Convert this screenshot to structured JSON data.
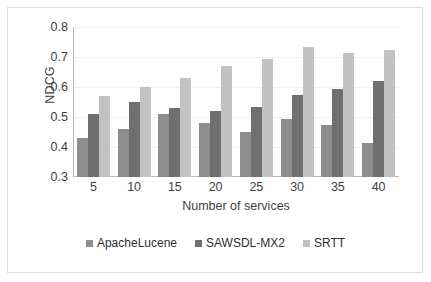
{
  "chart_data": {
    "type": "bar",
    "title": "",
    "subtitle": "",
    "xlabel": "Number of services",
    "ylabel": "NDCG",
    "categories": [
      "5",
      "10",
      "15",
      "20",
      "25",
      "30",
      "35",
      "40"
    ],
    "series": [
      {
        "name": "ApacheLucene",
        "color": "#8e8e8e",
        "values": [
          0.43,
          0.46,
          0.51,
          0.48,
          0.45,
          0.495,
          0.475,
          0.415
        ]
      },
      {
        "name": "SAWSDL-MX2",
        "color": "#6f6f6f",
        "values": [
          0.51,
          0.55,
          0.53,
          0.52,
          0.535,
          0.575,
          0.595,
          0.62
        ]
      },
      {
        "name": "SRTT",
        "color": "#c2c2c2",
        "values": [
          0.57,
          0.6,
          0.63,
          0.67,
          0.695,
          0.735,
          0.715,
          0.725
        ]
      }
    ],
    "ylim": [
      0.3,
      0.8
    ],
    "ytick_labels": [
      "0.8",
      "0.7",
      "0.6",
      "0.5",
      "0.4",
      "0.3"
    ],
    "ytick_values": [
      0.8,
      0.7,
      0.6,
      0.5,
      0.4,
      0.3
    ],
    "grid": true,
    "legend_position": "bottom"
  }
}
